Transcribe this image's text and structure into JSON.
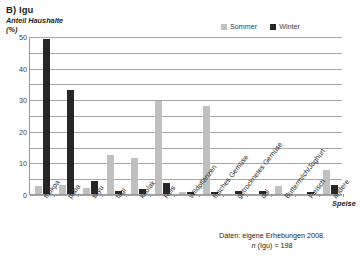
{
  "chart_data": {
    "type": "bar",
    "title": "B) Igu",
    "ylabel": "Anteil Haushalte (%)",
    "xlabel": "Speise",
    "ylim": [
      0,
      50
    ],
    "yticks": [
      0,
      10,
      20,
      30,
      40,
      50
    ],
    "ytick_labels": [
      "0",
      "10",
      "20",
      "30",
      "40",
      "50"
    ],
    "gridlines": [
      0,
      5,
      10,
      15,
      20,
      25,
      30,
      35,
      40,
      45,
      50
    ],
    "grid": true,
    "legend_position": "top-right",
    "categories": [
      "thukpa",
      "paba",
      "skyu",
      "tagi",
      "kholak",
      "Reis",
      "Wildpflanzen",
      "frisches Gemüse",
      "getrocknetes Gemüse",
      "dal",
      "Buttermilch/Joghurt",
      "Fleisch",
      "andere"
    ],
    "series": [
      {
        "name": "Sommer",
        "color": "#bfbfbf",
        "values": [
          2.5,
          3,
          2,
          12.5,
          11.5,
          29.5,
          0.5,
          28,
          0,
          0,
          2.5,
          0,
          7.5
        ]
      },
      {
        "name": "Winter",
        "color": "#262626",
        "values": [
          49,
          33,
          4,
          1,
          1.5,
          3.5,
          0.5,
          0.5,
          1,
          1,
          0,
          0.5,
          3
        ]
      }
    ],
    "annotations": {
      "source_line1": "Daten: eigene Erhebungen 2008.",
      "source_n_italic": "n",
      "source_n_rest": " (Igu) = 198"
    }
  }
}
